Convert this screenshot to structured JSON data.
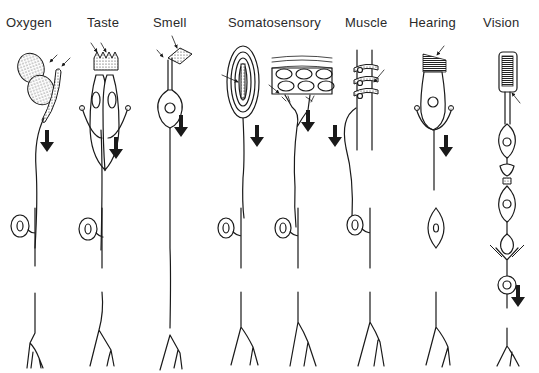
{
  "figure": {
    "type": "sensory-receptor-diagram",
    "columns": [
      {
        "id": "oxygen",
        "label": "Oxygen",
        "x": 6
      },
      {
        "id": "taste",
        "label": "Taste",
        "x": 87
      },
      {
        "id": "smell",
        "label": "Smell",
        "x": 153
      },
      {
        "id": "somatosensory",
        "label": "Somatosensory",
        "x": 228
      },
      {
        "id": "muscle",
        "label": "Muscle",
        "x": 345
      },
      {
        "id": "hearing",
        "label": "Hearing",
        "x": 409
      },
      {
        "id": "vision",
        "label": "Vision",
        "x": 483
      }
    ],
    "annotations": {
      "stimulus_arrows": "small arrows indicating stimulus at receptor site",
      "signal_arrows": "large downward arrows indicating direction of signal flow"
    }
  }
}
